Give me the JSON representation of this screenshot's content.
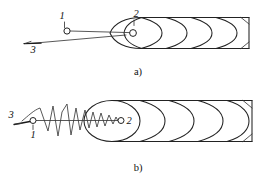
{
  "figure": {
    "title": "",
    "background_color": "#ffffff",
    "line_color": "#222222",
    "panels": [
      {
        "id": "a",
        "caption": "a)",
        "description": "straight-wire configuration inside conical-nose coiled tube",
        "callouts": [
          {
            "id": "1",
            "label": "1",
            "x": 62,
            "y": 19,
            "marker_x": 67,
            "marker_y": 31,
            "marker_r": 3.1
          },
          {
            "id": "2",
            "label": "2",
            "x": 136,
            "y": 17,
            "marker_x": 133,
            "marker_y": 33,
            "marker_r": 3.4
          },
          {
            "id": "3",
            "label": "3",
            "x": 33,
            "y": 53,
            "marker_x": 28,
            "marker_y": 43,
            "marker_r": 0
          }
        ]
      },
      {
        "id": "b",
        "caption": "b)",
        "description": "buckled zig-zag wire configuration inside ellipse-ended coiled tube",
        "callouts": [
          {
            "id": "3",
            "label": "3",
            "x": 11,
            "y": 118,
            "marker_x": 22,
            "marker_y": 121,
            "marker_r": 0
          },
          {
            "id": "1",
            "label": "1",
            "x": 31,
            "y": 133,
            "marker_x": 33,
            "marker_y": 120,
            "marker_r": 3.0
          },
          {
            "id": "2",
            "label": "2",
            "x": 128,
            "y": 124,
            "marker_x": 120,
            "marker_y": 120,
            "marker_r": 3.0
          }
        ]
      }
    ]
  }
}
